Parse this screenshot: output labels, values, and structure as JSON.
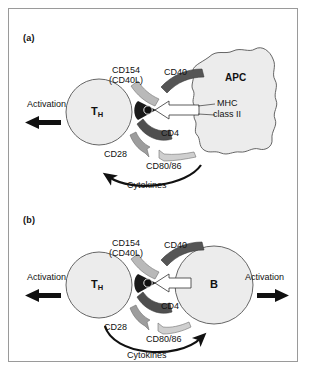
{
  "figure": {
    "background_color": "#ffffff",
    "frame_color": "#9a9a9a"
  },
  "colors": {
    "cell_fill": "#ececec",
    "cell_stroke": "#555555",
    "ligand_light": "#b9b9b9",
    "ligand_dark": "#555555",
    "ligand_mid": "#8f8f8f",
    "arrow_black": "#111111",
    "mhc_white": "#ffffff",
    "text": "#111111"
  },
  "panels": [
    {
      "id": "a",
      "label": "(a)",
      "left_cell": {
        "name": "T-helper cell",
        "label": "T",
        "sublabel": "H",
        "shape": "circle"
      },
      "right_cell": {
        "name": "antigen presenting cell",
        "label": "APC",
        "shape": "amoeboid-blob"
      },
      "outputs": [
        {
          "name": "left-activation",
          "label": "Activation",
          "direction": "left"
        }
      ],
      "receptor_pairs": [
        {
          "t_cell_side": "CD154",
          "t_cell_side_alt": "(CD40L)",
          "apc_side": "CD40"
        },
        {
          "t_cell_side": "CD4",
          "apc_side": "MHC class II",
          "apc_side_line1": "MHC",
          "apc_side_line2": "class II"
        },
        {
          "t_cell_side": "CD28",
          "apc_side": "CD80/86"
        }
      ],
      "cytokines": {
        "label": "Cytokines",
        "direction": "left"
      }
    },
    {
      "id": "b",
      "label": "(b)",
      "left_cell": {
        "name": "T-helper cell",
        "label": "T",
        "sublabel": "H",
        "shape": "circle"
      },
      "right_cell": {
        "name": "B cell",
        "label": "B",
        "shape": "circle"
      },
      "outputs": [
        {
          "name": "left-activation",
          "label": "Activation",
          "direction": "left"
        },
        {
          "name": "right-activation",
          "label": "Activation",
          "direction": "right"
        }
      ],
      "receptor_pairs": [
        {
          "t_cell_side": "CD154",
          "t_cell_side_alt": "(CD40L)",
          "apc_side": "CD40"
        },
        {
          "t_cell_side": "CD4",
          "apc_side": ""
        },
        {
          "t_cell_side": "CD28",
          "apc_side": "CD80/86"
        }
      ],
      "cytokines": {
        "label": "Cytokines",
        "direction": "right"
      }
    }
  ],
  "icons": {
    "tcr_peptide": "peptide-dot",
    "mhc_arrow": "mhc-class-ii-arrow",
    "activation_arrow": "thick-arrow",
    "cytokine_arrow": "curved-arrow"
  }
}
